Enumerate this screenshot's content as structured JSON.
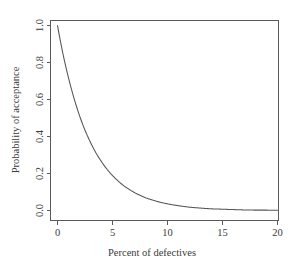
{
  "chart_data": {
    "type": "line",
    "title": "",
    "xlabel": "Percent of defectives",
    "ylabel": "Probability of acceptance",
    "xlim": [
      0,
      20
    ],
    "ylim": [
      0.0,
      1.0
    ],
    "grid": false,
    "legend": null,
    "xticks": [
      0,
      5,
      10,
      15,
      20
    ],
    "xticklabels": [
      "0",
      "5",
      "10",
      "15",
      "20"
    ],
    "yticks": [
      0.0,
      0.2,
      0.4,
      0.6,
      0.8,
      1.0
    ],
    "yticklabels": [
      "0.0",
      "0.2",
      "0.4",
      "0.6",
      "0.8",
      "1.0"
    ],
    "series": [
      {
        "name": "Operating characteristic curve",
        "x": [
          0,
          0.5,
          1,
          1.5,
          2,
          2.5,
          3,
          3.5,
          4,
          4.5,
          5,
          5.5,
          6,
          6.5,
          7,
          7.5,
          8,
          8.5,
          9,
          9.5,
          10,
          11,
          12,
          13,
          14,
          15,
          16,
          17,
          18,
          19,
          20
        ],
        "y": [
          1.0,
          0.846,
          0.717,
          0.607,
          0.513,
          0.434,
          0.368,
          0.311,
          0.264,
          0.223,
          0.189,
          0.16,
          0.135,
          0.115,
          0.097,
          0.082,
          0.069,
          0.059,
          0.05,
          0.042,
          0.036,
          0.026,
          0.018,
          0.013,
          0.009,
          0.007,
          0.005,
          0.003,
          0.002,
          0.002,
          0.001
        ]
      }
    ]
  },
  "style": {
    "line_color": "#555555",
    "axis_color": "#5a5a5a",
    "background": "#ffffff",
    "text_color": "#3a3a3a"
  }
}
